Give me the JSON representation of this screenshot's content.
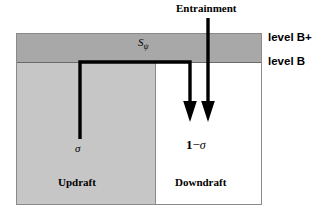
{
  "figure": {
    "type": "schematic-diagram",
    "background_color": "#ffffff"
  },
  "colors": {
    "band_bplus_fill": "#a8a8a8",
    "updraft_fill": "#c6c6c6",
    "downdraft_fill": "#ffffff",
    "box_border": "#8a8a8a",
    "level_b_line": "#6a6a6a",
    "flow_line": "#000000"
  },
  "labels": {
    "entrainment": "Entrainment",
    "level_b_plus": "level B+",
    "level_b": "level B",
    "s_symbol": "S",
    "s_subscript": "ψ",
    "sigma": "σ",
    "one": "1",
    "minus": "−",
    "one_minus_sigma_sigma": "σ",
    "updraft": "Updraft",
    "downdraft": "Downdraft"
  },
  "regions": [
    {
      "name": "level-b-plus-band",
      "label": "level B+",
      "fill": "#a8a8a8"
    },
    {
      "name": "updraft-column",
      "label": "Updraft",
      "fraction": "σ",
      "fill": "#c6c6c6"
    },
    {
      "name": "downdraft-column",
      "label": "Downdraft",
      "fraction": "1 − σ",
      "fill": "#ffffff"
    }
  ],
  "arrows": [
    {
      "name": "detrainment-flux-arrow",
      "label": "Sψ",
      "description": "flux path rising in updraft, crossing level B, turning down into downdraft"
    },
    {
      "name": "entrainment-arrow",
      "label": "Entrainment",
      "description": "vertical arrow descending from above into the downdraft column"
    }
  ]
}
